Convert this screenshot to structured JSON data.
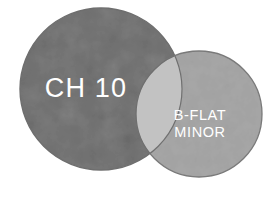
{
  "diagram": {
    "type": "venn-two-circle",
    "background_color": "#ffffff",
    "left_circle": {
      "label": "CH 10",
      "fill_color": "#ababab",
      "stroke_color": "#6e6e6e",
      "label_color": "#ffffff",
      "cx": 101,
      "cy": 89,
      "r": 81
    },
    "right_circle": {
      "label_line1": "B-FLAT",
      "label_line2": "MINOR",
      "fill_color": "#c9c9c9",
      "stroke_color": "#7a7a7a",
      "label_color": "#ffffff",
      "cx": 199,
      "cy": 114,
      "r": 63
    },
    "overlap": {
      "fill_color": "#c2c2c2"
    }
  }
}
